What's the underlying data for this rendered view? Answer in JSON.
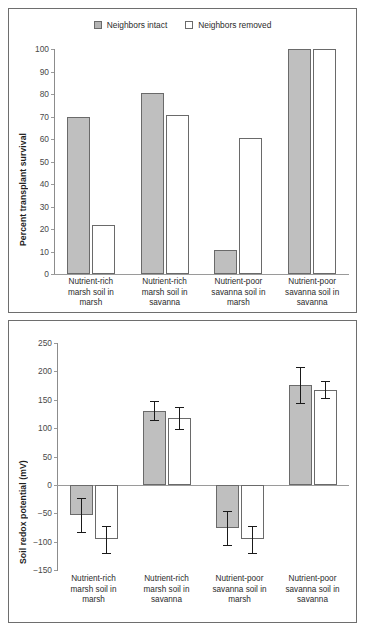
{
  "legend": {
    "items": [
      {
        "label": "Neighbors intact",
        "swatch": "gray",
        "color": "#bfbfbf"
      },
      {
        "label": "Neighbors removed",
        "swatch": "white",
        "color": "#ffffff"
      }
    ]
  },
  "categories": [
    "Nutrient-rich marsh soil in marsh",
    "Nutrient-rich marsh soil in savanna",
    "Nutrient-poor savanna soil in marsh",
    "Nutrient-poor savanna soil in savanna"
  ],
  "category_lines": [
    [
      "Nutrient-rich",
      "marsh soil in",
      "marsh"
    ],
    [
      "Nutrient-rich",
      "marsh soil in",
      "savanna"
    ],
    [
      "Nutrient-poor",
      "savanna soil in",
      "marsh"
    ],
    [
      "Nutrient-poor",
      "savanna soil in",
      "savanna"
    ]
  ],
  "chart_data": [
    {
      "type": "bar",
      "id": "percent-transplant-survival",
      "title": "",
      "xlabel": "",
      "ylabel": "Percent transplant survival",
      "ylim": [
        0,
        100
      ],
      "yticks": [
        0,
        10,
        20,
        30,
        40,
        50,
        60,
        70,
        80,
        90,
        100
      ],
      "ytick_labels": [
        "0",
        "10",
        "20",
        "30",
        "40",
        "50",
        "60",
        "70",
        "80",
        "90",
        "100"
      ],
      "grid": false,
      "legend_position": "top-center",
      "categories": [
        "Nutrient-rich marsh soil in marsh",
        "Nutrient-rich marsh soil in savanna",
        "Nutrient-poor savanna soil in marsh",
        "Nutrient-poor savanna soil in savanna"
      ],
      "series": [
        {
          "name": "Neighbors intact",
          "color": "#bfbfbf",
          "values": [
            70,
            80.5,
            10.5,
            100
          ]
        },
        {
          "name": "Neighbors removed",
          "color": "#ffffff",
          "values": [
            22,
            70.5,
            60.5,
            100
          ]
        }
      ],
      "errors": null
    },
    {
      "type": "bar",
      "id": "soil-redox-potential",
      "title": "",
      "xlabel": "",
      "ylabel": "Soil redox potential (mV)",
      "ylim": [
        -150,
        250
      ],
      "yticks": [
        -150,
        -100,
        -50,
        0,
        50,
        100,
        150,
        200,
        250
      ],
      "ytick_labels": [
        "−150",
        "−100",
        "−50",
        "0",
        "50",
        "100",
        "150",
        "200",
        "250"
      ],
      "grid": false,
      "legend_position": "none",
      "categories": [
        "Nutrient-rich marsh soil in marsh",
        "Nutrient-rich marsh soil in savanna",
        "Nutrient-poor savanna soil in marsh",
        "Nutrient-poor savanna soil in savanna"
      ],
      "series": [
        {
          "name": "Neighbors intact",
          "color": "#bfbfbf",
          "values": [
            -53,
            131,
            -76,
            176
          ]
        },
        {
          "name": "Neighbors removed",
          "color": "#ffffff",
          "values": [
            -96,
            118,
            -96,
            168
          ]
        }
      ],
      "errors": [
        {
          "name": "Neighbors intact",
          "values": [
            30,
            17,
            30,
            31
          ]
        },
        {
          "name": "Neighbors removed",
          "values": [
            24,
            20,
            24,
            15
          ]
        }
      ]
    }
  ]
}
